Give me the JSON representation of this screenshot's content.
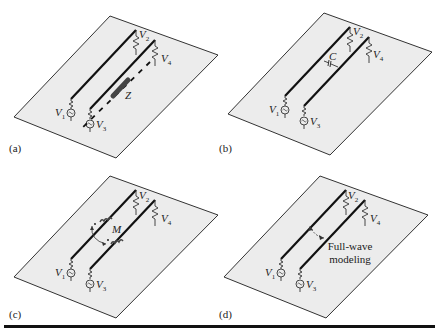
{
  "figure": {
    "panels": [
      {
        "id": "a",
        "caption": "(a)",
        "coupling_label": "Z",
        "coupling_type": "common impedance (ground path)",
        "labels": {
          "v1": "V",
          "v1_sub": "1",
          "v2": "V",
          "v2_sub": "2",
          "v3": "V",
          "v3_sub": "3",
          "v4": "V",
          "v4_sub": "4"
        }
      },
      {
        "id": "b",
        "caption": "(b)",
        "coupling_label": "C",
        "coupling_type": "capacitive coupling",
        "labels": {
          "v1": "V",
          "v1_sub": "1",
          "v2": "V",
          "v2_sub": "2",
          "v3": "V",
          "v3_sub": "3",
          "v4": "V",
          "v4_sub": "4"
        }
      },
      {
        "id": "c",
        "caption": "(c)",
        "coupling_label": "M",
        "coupling_type": "inductive (mutual) coupling",
        "labels": {
          "v1": "V",
          "v1_sub": "1",
          "v2": "V",
          "v2_sub": "2",
          "v3": "V",
          "v3_sub": "3",
          "v4": "V",
          "v4_sub": "4"
        }
      },
      {
        "id": "d",
        "caption": "(d)",
        "coupling_label": "Full-wave\nmodeling",
        "coupling_line1": "Full-wave",
        "coupling_line2": "modeling",
        "coupling_type": "full-wave",
        "labels": {
          "v1": "V",
          "v1_sub": "1",
          "v2": "V",
          "v2_sub": "2",
          "v3": "V",
          "v3_sub": "3",
          "v4": "V",
          "v4_sub": "4"
        }
      }
    ],
    "colors": {
      "plane_fill": "#ececec",
      "plane_stroke": "#333333",
      "wire": "#111111",
      "text": "#222222"
    }
  }
}
